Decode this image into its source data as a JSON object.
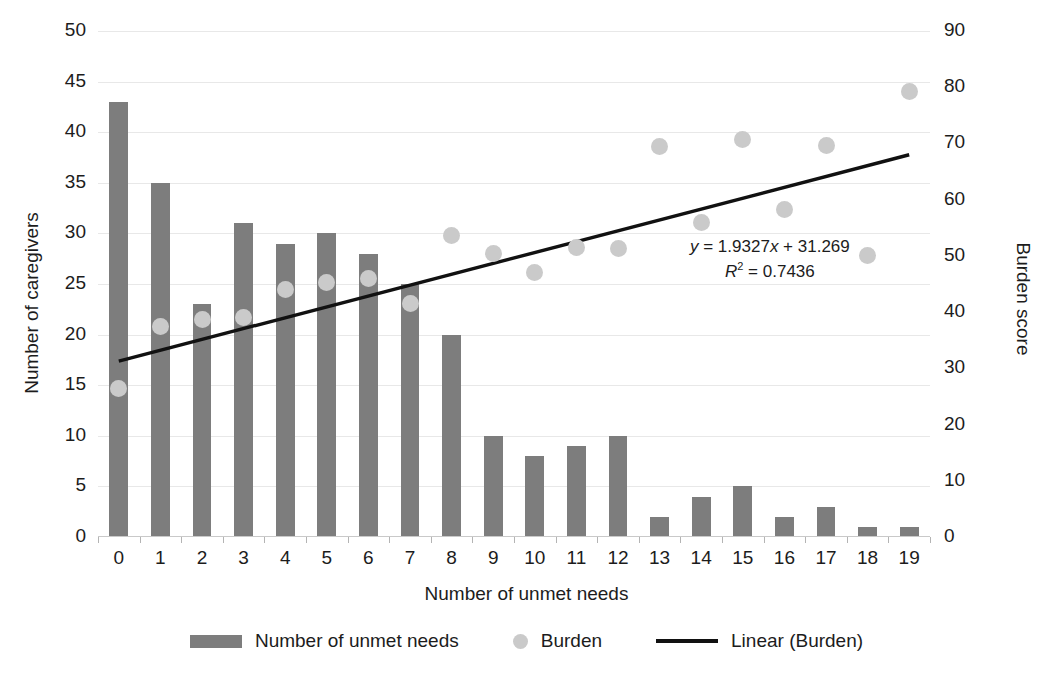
{
  "chart_data": {
    "type": "bar",
    "title": "",
    "xlabel": "Number of unmet needs",
    "ylabel": "Number of caregivers",
    "y2label": "Burden score",
    "categories": [
      "0",
      "1",
      "2",
      "3",
      "4",
      "5",
      "6",
      "7",
      "8",
      "9",
      "10",
      "11",
      "12",
      "13",
      "14",
      "15",
      "16",
      "17",
      "18",
      "19"
    ],
    "ylim": [
      0,
      50
    ],
    "y2lim": [
      0,
      90
    ],
    "yticks": [
      0,
      5,
      10,
      15,
      20,
      25,
      30,
      35,
      40,
      45,
      50
    ],
    "y2ticks": [
      0,
      10,
      20,
      30,
      40,
      50,
      60,
      70,
      80,
      90
    ],
    "grid": true,
    "legend_position": "bottom",
    "series": [
      {
        "name": "Number of unmet needs",
        "type": "bar",
        "axis": "left",
        "color": "#7d7d7d",
        "values": [
          43,
          35,
          23,
          31,
          29,
          30,
          28,
          25,
          20,
          10,
          8,
          9,
          10,
          2,
          4,
          5,
          2,
          3,
          1,
          1
        ]
      },
      {
        "name": "Burden",
        "type": "scatter",
        "axis": "right",
        "color": "#cacaca",
        "values": [
          26.5,
          37.5,
          38.6,
          39.1,
          44.0,
          45.2,
          45.9,
          41.5,
          53.6,
          50.5,
          47.0,
          51.5,
          51.3,
          69.5,
          56.0,
          70.7,
          58.2,
          69.6,
          50.0,
          79.2
        ]
      },
      {
        "name": "Linear (Burden)",
        "type": "line",
        "axis": "right",
        "color": "#111111",
        "fit": "linear",
        "slope": 1.9327,
        "intercept": 31.269,
        "r_squared": 0.7436,
        "x_start": 0,
        "x_end": 19,
        "y_start": 31.269,
        "y_end": 68.0906
      }
    ],
    "annotations": [
      {
        "name": "trendline-equation",
        "line1": "y = 1.9327x + 31.269",
        "line2": "R2 = 0.7436"
      }
    ]
  },
  "equation": {
    "y_symbol": "y",
    "eq_rest": " = 1.9327",
    "x_symbol": "x",
    "eq_tail": " + 31.269",
    "r_symbol": "R",
    "r_sup": "2",
    "r_rest": " = 0.7436"
  },
  "legend": {
    "items": [
      {
        "label": "Number of unmet needs",
        "marker": "bar-swatch"
      },
      {
        "label": "Burden",
        "marker": "dot-swatch"
      },
      {
        "label": "Linear (Burden)",
        "marker": "line-swatch"
      }
    ]
  },
  "axes": {
    "x_title": "Number of unmet needs",
    "y_left_title": "Number of caregivers",
    "y_right_title": "Burden score"
  }
}
